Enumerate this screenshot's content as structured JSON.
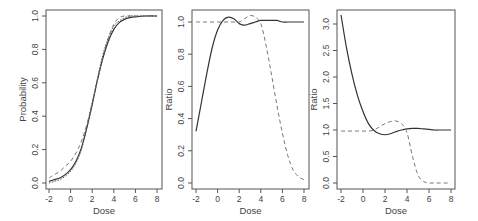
{
  "chart_data": [
    {
      "type": "line",
      "title": "",
      "xlabel": "Dose",
      "ylabel": "Probability",
      "xlim": [
        -2,
        8
      ],
      "ylim": [
        0,
        1
      ],
      "xticks": [
        -2,
        0,
        2,
        4,
        6,
        8
      ],
      "xtick_labels": [
        "-2",
        "0",
        "2",
        "4",
        "6",
        "8"
      ],
      "yticks": [
        0,
        0.2,
        0.4,
        0.6,
        0.8,
        1.0
      ],
      "ytick_labels": [
        "0.0",
        "0.2",
        "0.4",
        "0.6",
        "0.8",
        "1.0"
      ],
      "x": [
        -2,
        -1.5,
        -1,
        -0.5,
        0,
        0.5,
        1,
        1.5,
        2,
        2.5,
        3,
        3.5,
        4,
        4.5,
        5,
        5.5,
        6,
        7,
        8
      ],
      "series": [
        {
          "name": "solid",
          "style": "solid",
          "values": [
            0.01,
            0.02,
            0.03,
            0.05,
            0.08,
            0.13,
            0.21,
            0.33,
            0.47,
            0.62,
            0.75,
            0.85,
            0.92,
            0.96,
            0.98,
            0.99,
            0.995,
            1.0,
            1.0
          ]
        },
        {
          "name": "dashed",
          "style": "dashed",
          "values": [
            0.03,
            0.05,
            0.07,
            0.1,
            0.13,
            0.18,
            0.25,
            0.35,
            0.48,
            0.62,
            0.76,
            0.87,
            0.95,
            0.99,
            1.0,
            1.0,
            1.0,
            1.0,
            1.0
          ]
        },
        {
          "name": "dotted",
          "style": "dotted",
          "values": [
            0.0,
            0.01,
            0.02,
            0.04,
            0.07,
            0.12,
            0.2,
            0.33,
            0.48,
            0.63,
            0.77,
            0.87,
            0.94,
            0.97,
            0.99,
            1.0,
            1.0,
            1.0,
            1.0
          ]
        }
      ]
    },
    {
      "type": "line",
      "title": "",
      "xlabel": "Dose",
      "ylabel": "Ratio",
      "xlim": [
        -2,
        8
      ],
      "ylim": [
        0,
        1.05
      ],
      "xticks": [
        -2,
        0,
        2,
        4,
        6,
        8
      ],
      "xtick_labels": [
        "-2",
        "0",
        "2",
        "4",
        "6",
        "8"
      ],
      "yticks": [
        0,
        0.2,
        0.4,
        0.6,
        0.8,
        1.0
      ],
      "ytick_labels": [
        "0.0",
        "0.2",
        "0.4",
        "0.6",
        "0.8",
        "1.0"
      ],
      "x": [
        -2,
        -1.5,
        -1,
        -0.5,
        0,
        0.5,
        1,
        1.5,
        2,
        2.5,
        3,
        3.5,
        4,
        4.5,
        5,
        5.5,
        6,
        6.5,
        7,
        7.5,
        8
      ],
      "series": [
        {
          "name": "solid",
          "style": "solid",
          "values": [
            0.32,
            0.5,
            0.68,
            0.84,
            0.95,
            1.01,
            1.03,
            1.02,
            0.99,
            0.98,
            0.99,
            1.0,
            1.01,
            1.01,
            1.01,
            1.01,
            1.0,
            1.0,
            1.0,
            1.0,
            1.0
          ]
        },
        {
          "name": "dashed",
          "style": "dashed",
          "values": [
            1.0,
            1.0,
            1.0,
            1.0,
            1.0,
            1.0,
            1.0,
            1.0,
            1.0,
            1.02,
            1.04,
            1.03,
            0.99,
            0.85,
            0.67,
            0.48,
            0.31,
            0.17,
            0.08,
            0.04,
            0.02
          ]
        }
      ]
    },
    {
      "type": "line",
      "title": "",
      "xlabel": "Dose",
      "ylabel": "Ratio",
      "xlim": [
        -2,
        8
      ],
      "ylim": [
        0,
        3.2
      ],
      "xticks": [
        -2,
        0,
        2,
        4,
        6,
        8
      ],
      "xtick_labels": [
        "-2",
        "0",
        "2",
        "4",
        "6",
        "8"
      ],
      "yticks": [
        0,
        0.5,
        1.0,
        1.5,
        2.0,
        2.5,
        3.0
      ],
      "ytick_labels": [
        "0.0",
        "0.5",
        "1.0",
        "1.5",
        "2.0",
        "2.5",
        "3.0"
      ],
      "x": [
        -2,
        -1.5,
        -1,
        -0.5,
        0,
        0.5,
        1,
        1.5,
        2,
        2.5,
        3,
        3.5,
        4,
        4.5,
        5,
        5.5,
        6,
        6.5,
        7,
        7.5,
        8
      ],
      "series": [
        {
          "name": "solid",
          "style": "solid",
          "values": [
            3.17,
            2.55,
            2.05,
            1.65,
            1.35,
            1.12,
            0.99,
            0.93,
            0.91,
            0.93,
            0.97,
            1.0,
            1.02,
            1.03,
            1.03,
            1.02,
            1.01,
            1.0,
            1.0,
            1.0,
            1.0
          ]
        },
        {
          "name": "dashed",
          "style": "dashed",
          "values": [
            0.98,
            0.98,
            0.98,
            0.98,
            0.98,
            0.98,
            1.0,
            1.06,
            1.12,
            1.16,
            1.17,
            1.12,
            0.95,
            0.5,
            0.15,
            0.03,
            0.0,
            0.0,
            0.0,
            0.0,
            0.0
          ]
        }
      ]
    }
  ]
}
